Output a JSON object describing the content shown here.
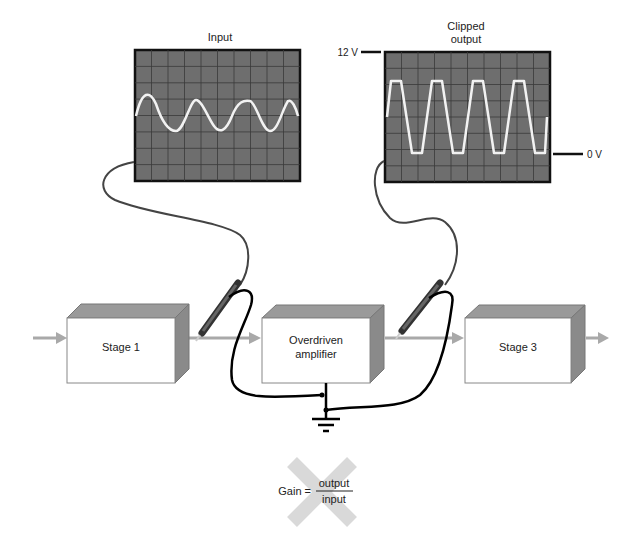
{
  "scopes": {
    "input": {
      "title": "Input",
      "waveform": "sine",
      "cycles": 4
    },
    "output": {
      "title_line1": "Clipped",
      "title_line2": "output",
      "waveform": "clipped-sine",
      "cycles": 4,
      "top_marker": "12 V",
      "bottom_marker": "0 V"
    }
  },
  "stages": [
    {
      "label_line1": "Stage 1",
      "label_line2": ""
    },
    {
      "label_line1": "Overdriven",
      "label_line2": "amplifier"
    },
    {
      "label_line1": "Stage 3",
      "label_line2": ""
    }
  ],
  "formula": {
    "left": "Gain =",
    "numerator": "output",
    "denominator": "input",
    "crossed_out": true
  },
  "colors": {
    "screen": "#6e6e6e",
    "grid": "#3a3a3a",
    "trace": "#f2f2f2",
    "arrow": "#a9a9a9",
    "box_side": "#8a8a8a",
    "box_top": "#9a9a9a",
    "cross": "#d9d9d9"
  }
}
